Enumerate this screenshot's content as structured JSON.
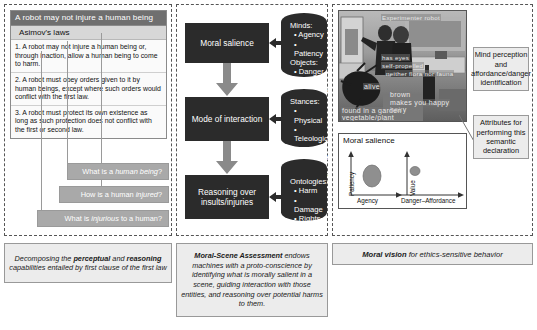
{
  "left_panel": {
    "name": "perceptual-reasoning-decomposition",
    "law_header": "A robot may not injure a human being",
    "laws_subtitle": "Asimov's laws",
    "laws": [
      "1. A robot may not injure a human being or, through inaction, allow a human being to come to harm.",
      "2. A robot must obey orders given to it by human beings, except where such orders would conflict with the first law.",
      "3. A robot must protect its own existence as long as such protection does not conflict with the first or second law."
    ],
    "questions": [
      {
        "pre": "What is a ",
        "em": "human being",
        "post": "?"
      },
      {
        "pre": "How is a human ",
        "em": "injured",
        "post": "?"
      },
      {
        "pre": "What is ",
        "em": "injurious",
        "post": " to a human?"
      }
    ],
    "caption_pre": "Decomposing the ",
    "caption_b1": "perceptual",
    "caption_mid": " and ",
    "caption_b2": "reasoning",
    "caption_post": " capabilities entailed by first clause of the first law"
  },
  "middle_panel": {
    "name": "moral-scene-assessment-pipeline",
    "stages": [
      {
        "label": "Moral salience"
      },
      {
        "label": "Mode of interaction"
      },
      {
        "label": "Reasoning over insults/injuries"
      }
    ],
    "stores": [
      {
        "heading1": "Minds:",
        "items1": [
          "Agency",
          "Patiency"
        ],
        "heading2": "Objects:",
        "items2": [
          "Danger",
          "Affordance"
        ]
      },
      {
        "heading1": "Stances:",
        "items1": [
          "Physical",
          "Teleological",
          "Intentional",
          "Phenomenal"
        ],
        "heading2": "",
        "items2": []
      },
      {
        "heading1": "Ontologies:",
        "items1": [
          "Harm",
          "Damage",
          "Rights"
        ],
        "heading2": "",
        "items2": []
      }
    ],
    "caption_b": "Moral-Scene Assessment",
    "caption_rest": " endows machines with a proto-conscience by identifying what is morally salient in a scene, guiding interaction with those entities, and reasoning over potential harms to them."
  },
  "right_panel": {
    "name": "moral-vision",
    "scene_tags": [
      "Experimenter robot",
      "has eyes",
      "self-propelled",
      "neither flora nor fauna",
      "alive",
      "brown",
      "makes you happy",
      "hairy",
      "found in a garden",
      "vegetable/plant"
    ],
    "salience": {
      "title": "Moral salience",
      "plot1": {
        "ylabel": "Patiency",
        "xlabel": "Agency"
      },
      "plot2": {
        "ylabel": "Value",
        "xlabel": "Danger–Affordance"
      }
    },
    "side_boxes": [
      "Mind perception and affordance/danger identification",
      "Attributes for performing this semantic declaration"
    ],
    "caption_b": "Moral vision",
    "caption_rest": " for ethics-sensitive behavior"
  },
  "colors": {
    "dark_box": "#2b2b2b",
    "arrow": "#8a8a8a",
    "question_box": "#a9a9a9",
    "caption_bg": "#ececec",
    "law_header_bg": "#6f6f6f"
  }
}
